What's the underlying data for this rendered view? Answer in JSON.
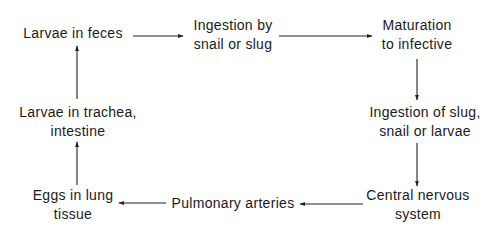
{
  "diagram": {
    "type": "cycle",
    "nodes": [
      {
        "id": "larvae-feces",
        "lines": [
          "Larvae in feces"
        ]
      },
      {
        "id": "ingestion-snail",
        "lines": [
          "Ingestion by",
          "snail or slug"
        ]
      },
      {
        "id": "maturation",
        "lines": [
          "Maturation",
          "to infective"
        ]
      },
      {
        "id": "ingestion-slug",
        "lines": [
          "Ingestion of slug,",
          "snail or larvae"
        ]
      },
      {
        "id": "cns",
        "lines": [
          "Central nervous",
          "system"
        ]
      },
      {
        "id": "pulmonary",
        "lines": [
          "Pulmonary arteries"
        ]
      },
      {
        "id": "eggs-lung",
        "lines": [
          "Eggs in lung",
          "tissue"
        ]
      },
      {
        "id": "larvae-trachea",
        "lines": [
          "Larvae in trachea,",
          "intestine"
        ]
      }
    ],
    "edges": [
      {
        "from": "larvae-feces",
        "to": "ingestion-snail",
        "direction": "right"
      },
      {
        "from": "ingestion-snail",
        "to": "maturation",
        "direction": "right"
      },
      {
        "from": "maturation",
        "to": "ingestion-slug",
        "direction": "down"
      },
      {
        "from": "ingestion-slug",
        "to": "cns",
        "direction": "down"
      },
      {
        "from": "cns",
        "to": "pulmonary",
        "direction": "left"
      },
      {
        "from": "pulmonary",
        "to": "eggs-lung",
        "direction": "left"
      },
      {
        "from": "eggs-lung",
        "to": "larvae-trachea",
        "direction": "up"
      },
      {
        "from": "larvae-trachea",
        "to": "larvae-feces",
        "direction": "up"
      }
    ],
    "colors": {
      "text": "#1a1a1a",
      "arrow": "#222222",
      "background": "#ffffff"
    }
  }
}
